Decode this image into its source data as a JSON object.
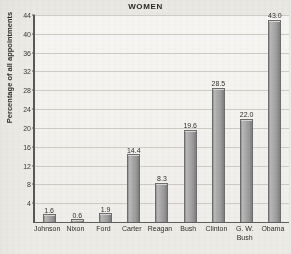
{
  "chart_data": {
    "type": "bar",
    "title": "WOMEN",
    "xlabel": "",
    "ylabel": "Percentage of all appointments",
    "categories": [
      "Johnson",
      "Nixon",
      "Ford",
      "Carter",
      "Reagan",
      "Bush",
      "Clinton",
      "G. W. Bush",
      "Obama"
    ],
    "category_lines": [
      [
        "Johnson"
      ],
      [
        "Nixon"
      ],
      [
        "Ford"
      ],
      [
        "Carter"
      ],
      [
        "Reagan"
      ],
      [
        "Bush"
      ],
      [
        "Clinton"
      ],
      [
        "G. W.",
        "Bush"
      ],
      [
        "Obama"
      ]
    ],
    "values": [
      1.6,
      0.6,
      1.9,
      14.4,
      8.3,
      19.6,
      28.5,
      22.0,
      43.0
    ],
    "value_labels": [
      "1.6",
      "0.6",
      "1.9",
      "14.4",
      "8.3",
      "19.6",
      "28.5",
      "22.0",
      "43.0"
    ],
    "ylim": [
      0,
      44
    ],
    "yticks": [
      4,
      8,
      12,
      16,
      20,
      24,
      28,
      32,
      36,
      40,
      44
    ],
    "ytick_labels": [
      "4",
      "8",
      "12",
      "16",
      "20",
      "24",
      "28",
      "32",
      "36",
      "40",
      "44"
    ],
    "grid": true,
    "legend": false,
    "colors": {
      "bar_fill": "#a9a9a9",
      "bar_edge": "#6d6d6d",
      "gridline": "#cfccc6",
      "axis": "#575757",
      "text": "#2f2f2f",
      "background": "#edebe6"
    }
  }
}
